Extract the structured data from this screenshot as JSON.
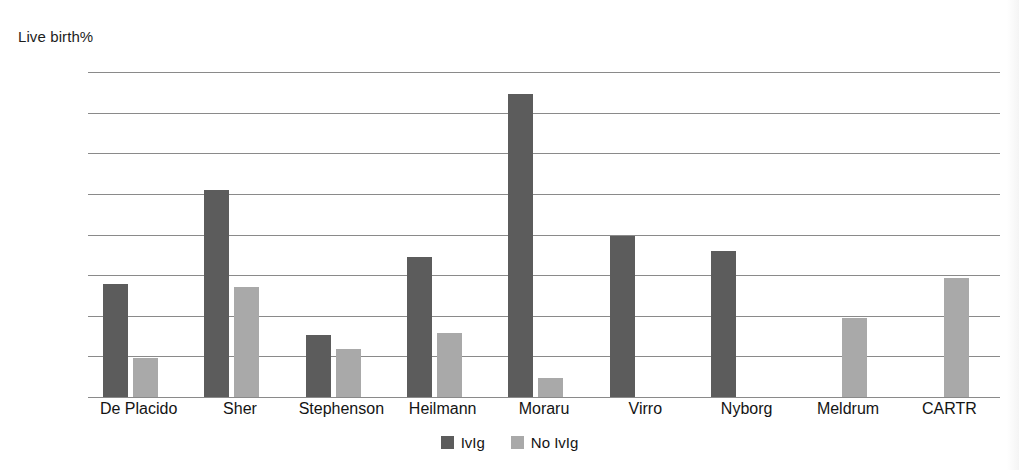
{
  "chart_data": {
    "type": "bar",
    "title": "",
    "ylabel": "Live birth%",
    "xlabel": "",
    "ylim": [
      0,
      80
    ],
    "yticks": [
      0,
      10,
      20,
      30,
      40,
      50,
      60,
      70,
      80
    ],
    "ytick_labels": [
      "0",
      "10",
      "20",
      "30",
      "40",
      "50",
      "60",
      "70",
      "80"
    ],
    "grid": true,
    "legend_position": "bottom-center",
    "categories": [
      "De Placido",
      "Sher",
      "Stephenson",
      "Heilmann",
      "Moraru",
      "Virro",
      "Nyborg",
      "Meldrum",
      "CARTR"
    ],
    "series": [
      {
        "name": "IvIg",
        "color": "#5c5c5c",
        "values": [
          27.8,
          51.0,
          15.2,
          34.5,
          74.7,
          39.7,
          36.0,
          null,
          null
        ]
      },
      {
        "name": "No IvIg",
        "color": "#a9a9a9",
        "values": [
          9.6,
          27.0,
          11.8,
          15.8,
          4.8,
          null,
          null,
          19.5,
          29.3
        ]
      }
    ]
  },
  "legend": {
    "items": [
      {
        "label": "IvIg"
      },
      {
        "label": "No IvIg"
      }
    ]
  },
  "colors": {
    "series_ivig": "#5c5c5c",
    "series_no_ivig": "#a9a9a9",
    "gridline": "#8a8a8a",
    "text": "#141414",
    "background": "#ffffff"
  }
}
